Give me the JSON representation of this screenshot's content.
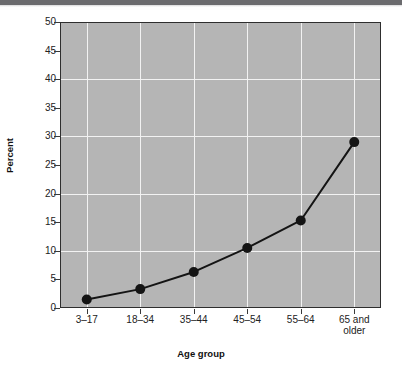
{
  "figure": {
    "background_color": "#ffffff",
    "plot_background_color": "#b5b5b5",
    "gridline_color": "#f2f2f2",
    "series_color": "#141414",
    "top_bar_color": "#6b6b6e"
  },
  "chart_data": {
    "type": "line",
    "title": "",
    "xlabel": "Age group",
    "ylabel": "Percent",
    "categories": [
      "3–17",
      "18–34",
      "35–44",
      "45–54",
      "55–64",
      "65 and\nolder"
    ],
    "category_lines": [
      [
        "3–17"
      ],
      [
        "18–34"
      ],
      [
        "35–44"
      ],
      [
        "45–54"
      ],
      [
        "55–64"
      ],
      [
        "65 and",
        "older"
      ]
    ],
    "values": [
      1.5,
      3.3,
      6.3,
      10.5,
      15.3,
      29.0
    ],
    "ylim": [
      0,
      50
    ],
    "ytick_values": [
      0,
      5,
      10,
      15,
      20,
      25,
      30,
      35,
      40,
      45,
      50
    ],
    "ytick_labels": [
      "0",
      "5",
      "10",
      "15",
      "20",
      "25",
      "30",
      "35",
      "40",
      "45",
      "50"
    ],
    "gridlines_horizontal_at": [
      10,
      20,
      30,
      40
    ],
    "grid": true,
    "legend": null,
    "marker": "filled-circle",
    "series": [
      {
        "name": "Percent",
        "values": [
          1.5,
          3.3,
          6.3,
          10.5,
          15.3,
          29.0
        ]
      }
    ]
  }
}
